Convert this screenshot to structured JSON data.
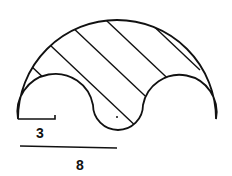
{
  "figure": {
    "labels": {
      "small_dimension": "3",
      "large_dimension": "8"
    },
    "colors": {
      "stroke": "#111111",
      "background": "#ffffff"
    }
  }
}
